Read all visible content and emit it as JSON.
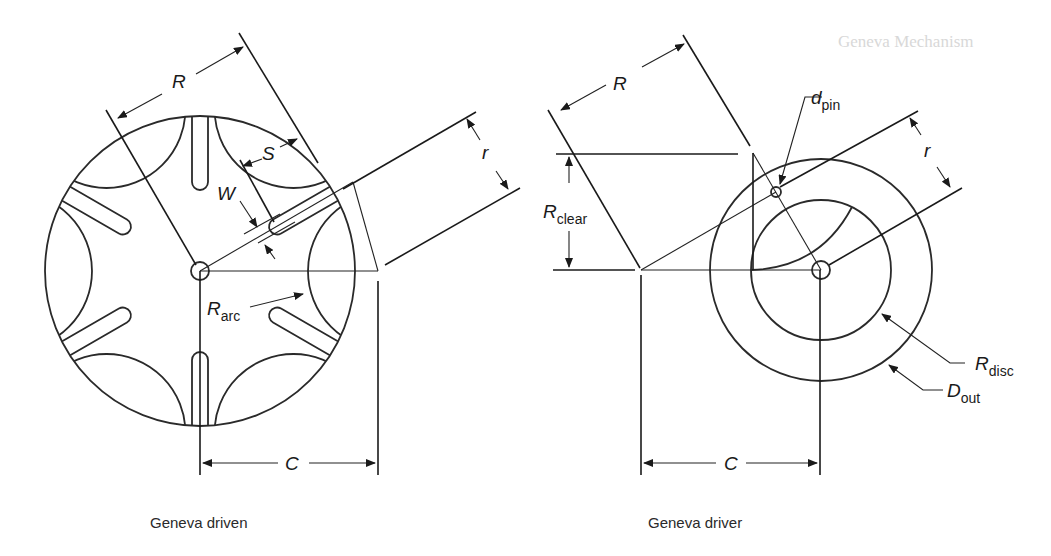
{
  "background_ghost": {
    "heading": "Geneva Mechanism"
  },
  "driven": {
    "caption": "Geneva driven",
    "labels": {
      "R": "R",
      "S": "S",
      "W": "W",
      "r": "r",
      "R_arc_main": "R",
      "R_arc_sub": "arc",
      "C": "C"
    },
    "slot_count": 6
  },
  "driver": {
    "caption": "Geneva driver",
    "labels": {
      "R": "R",
      "d_pin_main": "d",
      "d_pin_sub": "pin",
      "r": "r",
      "R_clear_main": "R",
      "R_clear_sub": "clear",
      "R_disc_main": "R",
      "R_disc_sub": "disc",
      "D_out_main": "D",
      "D_out_sub": "out",
      "C": "C"
    }
  },
  "colors": {
    "line": "#1a1a1a",
    "background": "#ffffff"
  }
}
